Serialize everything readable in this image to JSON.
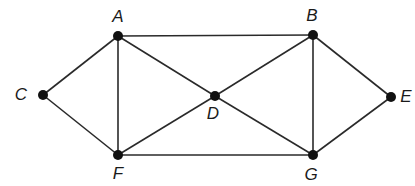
{
  "diagram": {
    "type": "undirected-graph",
    "nodes": [
      {
        "id": "A",
        "label": "A",
        "x": 118,
        "y": 36,
        "lx": 118,
        "ly": 18
      },
      {
        "id": "B",
        "label": "B",
        "x": 313,
        "y": 35,
        "lx": 312,
        "ly": 17
      },
      {
        "id": "C",
        "label": "C",
        "x": 43,
        "y": 95,
        "lx": 21,
        "ly": 96
      },
      {
        "id": "D",
        "label": "D",
        "x": 215,
        "y": 96,
        "lx": 213,
        "ly": 115
      },
      {
        "id": "E",
        "label": "E",
        "x": 391,
        "y": 97,
        "lx": 406,
        "ly": 98
      },
      {
        "id": "F",
        "label": "F",
        "x": 118,
        "y": 155,
        "lx": 118,
        "ly": 175
      },
      {
        "id": "G",
        "label": "G",
        "x": 313,
        "y": 155,
        "lx": 311,
        "ly": 176
      }
    ],
    "edges": [
      [
        "A",
        "B"
      ],
      [
        "A",
        "C"
      ],
      [
        "A",
        "F"
      ],
      [
        "A",
        "D"
      ],
      [
        "C",
        "F"
      ],
      [
        "F",
        "D"
      ],
      [
        "F",
        "G"
      ],
      [
        "D",
        "B"
      ],
      [
        "D",
        "G"
      ],
      [
        "B",
        "G"
      ],
      [
        "B",
        "E"
      ],
      [
        "E",
        "G"
      ]
    ],
    "colors": {
      "edge": "#2a2a2a",
      "node": "#111111",
      "label": "#1a1a1a",
      "background": "#ffffff"
    },
    "node_radius": 5
  }
}
